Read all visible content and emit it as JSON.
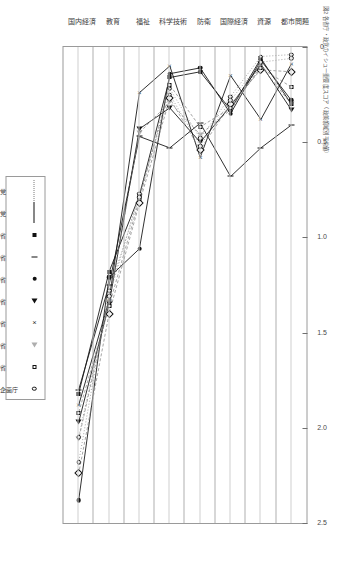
{
  "figure": {
    "title": "図2 各省庁・政党のイシュー重要度スコア（政策領域別平均値）"
  },
  "chart_data": {
    "type": "line",
    "title": "各省庁・政党のイシュー重要度スコア（政策領域別平均値）",
    "orientation": "horizontal-rotated",
    "xlabel": "",
    "ylabel": "",
    "xlim": [
      0,
      2.5
    ],
    "xticks": [
      0,
      0.5,
      1.0,
      1.5,
      2.0,
      2.5
    ],
    "xticklabels": [
      "0",
      "0.5",
      "1.0",
      "1.5",
      "2.0",
      "2.5"
    ],
    "grid": false,
    "legend_position": "bottom-center",
    "categories": [
      "都市問題",
      "資源",
      "国際経済",
      "防衛",
      "科学技術",
      "福祉",
      "教育",
      "国内経済"
    ],
    "series": [
      {
        "name": "経済企画庁",
        "marker": "square-filled",
        "line": "solid",
        "values": [
          0.3,
          0.06,
          0.33,
          0.13,
          0.16,
          0.78,
          1.18,
          1.82
        ]
      },
      {
        "name": "大蔵省",
        "marker": "bar",
        "line": "solid",
        "values": [
          0.41,
          0.53,
          0.68,
          0.4,
          0.53,
          0.47,
          1.25,
          1.8
        ]
      },
      {
        "name": "厚生省",
        "marker": "circle-filled",
        "line": "solid",
        "values": [
          0.28,
          0.07,
          0.35,
          0.11,
          0.14,
          1.06,
          1.21,
          2.38
        ]
      },
      {
        "name": "農林省",
        "marker": "triangle-right",
        "line": "solid",
        "values": [
          0.33,
          0.09,
          0.31,
          0.5,
          0.32,
          0.43,
          1.35,
          1.97
        ]
      },
      {
        "name": "通産省",
        "marker": "cross",
        "line": "solid",
        "values": [
          0.09,
          0.38,
          0.15,
          0.58,
          0.1,
          0.24,
          1.33,
          1.88
        ]
      },
      {
        "name": "労働省",
        "marker": "triangle-open",
        "line": "dashed",
        "values": [
          0.3,
          0.1,
          0.33,
          0.46,
          0.29,
          0.45,
          1.34,
          2.06
        ]
      },
      {
        "name": "建設省",
        "marker": "diamond-open",
        "line": "dashed",
        "values": [
          0.13,
          0.12,
          0.3,
          0.54,
          0.27,
          0.82,
          1.4,
          2.24
        ]
      },
      {
        "name": "自治省",
        "marker": "square-open",
        "line": "dashed",
        "values": [
          0.21,
          0.11,
          0.32,
          0.42,
          0.2,
          0.8,
          1.36,
          1.92
        ]
      },
      {
        "name": "自民党",
        "marker": "circle-open",
        "line": "dotted",
        "values": [
          0.06,
          0.08,
          0.28,
          0.52,
          0.25,
          0.77,
          1.31,
          2.05
        ]
      },
      {
        "name": "民社党",
        "marker": "circle-open2",
        "line": "dotted",
        "values": [
          0.04,
          0.05,
          0.26,
          0.48,
          0.22,
          0.79,
          1.28,
          2.18
        ]
      }
    ]
  },
  "legend": {
    "entries": [
      {
        "label": "民社党",
        "glyph": "dotted-line"
      },
      {
        "label": "自民党",
        "glyph": "solid-line"
      },
      {
        "label": "自治省",
        "glyph": "square-filled"
      },
      {
        "label": "建設省",
        "glyph": "bar"
      },
      {
        "label": "労働省",
        "glyph": "circle-filled"
      },
      {
        "label": "通産省",
        "glyph": "triangle-right"
      },
      {
        "label": "農林省",
        "glyph": "cross"
      },
      {
        "label": "厚生省",
        "glyph": "triangle-open"
      },
      {
        "label": "大蔵省",
        "glyph": "square-open"
      },
      {
        "label": "経済企画庁",
        "glyph": "circle-open"
      }
    ]
  },
  "axis": {
    "ticklabels": [
      "0",
      "0.5",
      "1.0",
      "1.5",
      "2.0",
      "2.5"
    ],
    "categories": [
      "都市問題",
      "資源",
      "国際経済",
      "防衛",
      "科学技術",
      "福祉",
      "教育",
      "国内経済"
    ]
  },
  "colors": {
    "frame": "#9a9a9a",
    "marker": "#111111",
    "gridline": "#b0b0b0"
  }
}
